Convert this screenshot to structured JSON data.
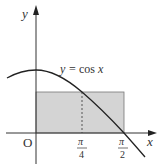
{
  "diagram": {
    "type": "graph-with-rectangle",
    "function_label": "y = cos x",
    "function_label_parts": {
      "y": "y",
      "eq": "=",
      "cos": "cos",
      "x": "x"
    },
    "axes": {
      "x_label": "x",
      "y_label": "y",
      "origin_label": "O"
    },
    "ticks": [
      {
        "num": "π",
        "den": "4",
        "value": 0.7854
      },
      {
        "num": "π",
        "den": "2",
        "value": 1.5708
      }
    ],
    "rectangle": {
      "x_from": "0",
      "x_to": "π/2",
      "height": "cos(π/4)",
      "fill": "#d4d4d4"
    },
    "dotted_line_at": "π/4",
    "colors": {
      "curve": "#222222",
      "axis": "#333333",
      "rect_fill": "#d4d4d4",
      "rect_stroke": "#555555"
    }
  }
}
